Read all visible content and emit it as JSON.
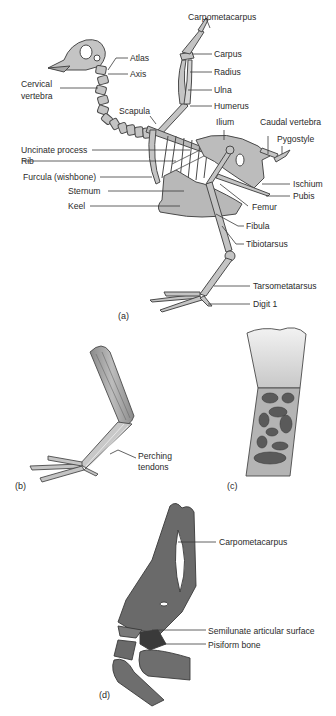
{
  "figure": {
    "colors": {
      "bone_fill": "#c4c4c4",
      "bone_outline": "#4a4a4a",
      "leader_line": "#3a3a3a",
      "dark_bone": "#5f5f5f",
      "pisiform": "#3a3a3a",
      "text": "#2a2a2a"
    },
    "panel_a": {
      "caption": "(a)",
      "labels": {
        "carpometacarpus": "Carpometacarpus",
        "atlas": "Atlas",
        "carpus": "Carpus",
        "axis": "Axis",
        "radius": "Radius",
        "cervical_vertebra_1": "Cervical",
        "cervical_vertebra_2": "vertebra",
        "ulna": "Ulna",
        "humerus": "Humerus",
        "scapula": "Scapula",
        "ilium": "Ilium",
        "caudal_vertebra": "Caudal vertebra",
        "pygostyle": "Pygostyle",
        "uncinate_process": "Uncinate process",
        "rib": "Rib",
        "furcula": "Furcula (wishbone)",
        "ischium": "Ischium",
        "sternum": "Sternum",
        "pubis": "Pubis",
        "keel": "Keel",
        "femur": "Femur",
        "fibula": "Fibula",
        "tibiotarsus": "Tibiotarsus",
        "tarsometatarsus": "Tarsometatarsus",
        "digit_1": "Digit 1"
      }
    },
    "panel_b": {
      "caption": "(b)",
      "labels": {
        "perching_1": "Perching",
        "perching_2": "tendons"
      }
    },
    "panel_c": {
      "caption": "(c)"
    },
    "panel_d": {
      "caption": "(d)",
      "labels": {
        "carpometacarpus": "Carpometacarpus",
        "semilunate": "Semilunate articular surface",
        "pisiform": "Pisiform bone"
      }
    }
  }
}
